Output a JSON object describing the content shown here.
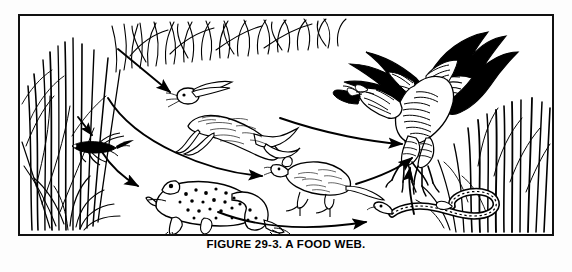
{
  "figure": {
    "caption": "FIGURE 29-3.  A FOOD WEB.",
    "caption_number": "29-3",
    "caption_title": "A FOOD WEB.",
    "border_color": "#111111",
    "ink_color": "#000000",
    "background_color": "#ffffff",
    "style": "black-and-white line drawing / pen-and-ink illustration"
  },
  "scene": {
    "habitat": "grassland / meadow",
    "vegetation": [
      {
        "name": "grass-clump-left",
        "label": "grass",
        "position": "left edge",
        "description": "dense tall clump of grass blades"
      },
      {
        "name": "grass-band-top",
        "label": "grass",
        "position": "top band",
        "description": "sparse thin grass blades across the top"
      },
      {
        "name": "grass-clump-right",
        "label": "grass",
        "position": "right edge",
        "description": "tall vertical grass blades behind the hawk"
      }
    ]
  },
  "organisms": [
    {
      "id": "grass",
      "label": "grass",
      "trophic_level": "producer",
      "position": "left"
    },
    {
      "id": "rabbit",
      "label": "rabbit",
      "trophic_level": "primary consumer",
      "position": "upper middle"
    },
    {
      "id": "grasshopper",
      "label": "grasshopper",
      "trophic_level": "primary consumer",
      "position": "left middle"
    },
    {
      "id": "frog",
      "label": "frog",
      "trophic_level": "secondary consumer",
      "position": "lower left middle"
    },
    {
      "id": "mouse",
      "label": "mouse",
      "trophic_level": "primary consumer",
      "position": "center"
    },
    {
      "id": "snake",
      "label": "snake",
      "trophic_level": "tertiary consumer",
      "position": "lower right"
    },
    {
      "id": "hawk",
      "label": "hawk",
      "trophic_level": "top predator",
      "position": "right"
    }
  ],
  "arrows": [
    {
      "id": "grass-to-rabbit",
      "from": "grass",
      "to": "rabbit",
      "shape": "straight"
    },
    {
      "id": "grass-to-grasshopper",
      "from": "grass",
      "to": "grasshopper",
      "shape": "straight"
    },
    {
      "id": "grass-to-mouse",
      "from": "grass",
      "to": "mouse",
      "shape": "curved"
    },
    {
      "id": "grasshopper-to-frog",
      "from": "grasshopper",
      "to": "frog",
      "shape": "curved"
    },
    {
      "id": "rabbit-to-hawk",
      "from": "rabbit",
      "to": "hawk",
      "shape": "curved"
    },
    {
      "id": "mouse-to-hawk",
      "from": "mouse",
      "to": "hawk",
      "shape": "curved"
    },
    {
      "id": "frog-to-snake",
      "from": "frog",
      "to": "snake",
      "shape": "curved"
    },
    {
      "id": "snake-to-hawk",
      "from": "snake",
      "to": "hawk",
      "shape": "curved"
    }
  ]
}
